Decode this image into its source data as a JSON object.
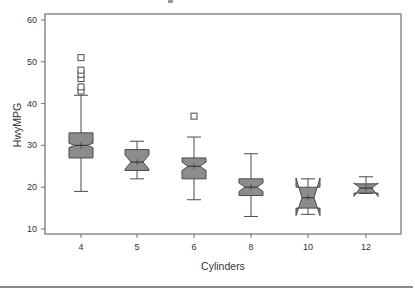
{
  "chart_data": {
    "type": "boxplot",
    "title": "",
    "xlabel": "Cylinders",
    "ylabel": "HwyMPG",
    "ylim": [
      10,
      60
    ],
    "yticks": [
      10,
      20,
      30,
      40,
      50,
      60
    ],
    "categories": [
      "4",
      "5",
      "6",
      "8",
      "10",
      "12"
    ],
    "notched": true,
    "grid": false,
    "legend": null,
    "boxes": [
      {
        "category": "4",
        "whisker_low": 19,
        "q1": 27,
        "median": 30,
        "q3": 33,
        "whisker_high": 42,
        "notch_low": 29.5,
        "notch_high": 30.5,
        "outliers": [
          43,
          44,
          46,
          47,
          48,
          51
        ]
      },
      {
        "category": "5",
        "whisker_low": 22,
        "q1": 24,
        "median": 26,
        "q3": 29,
        "whisker_high": 31,
        "notch_low": 24.3,
        "notch_high": 27.7,
        "outliers": []
      },
      {
        "category": "6",
        "whisker_low": 17,
        "q1": 22,
        "median": 25,
        "q3": 27,
        "whisker_high": 32,
        "notch_low": 24,
        "notch_high": 26,
        "outliers": [
          37
        ]
      },
      {
        "category": "8",
        "whisker_low": 13,
        "q1": 18,
        "median": 20,
        "q3": 22,
        "whisker_high": 28,
        "notch_low": 19,
        "notch_high": 21,
        "outliers": []
      },
      {
        "category": "10",
        "whisker_low": 13.5,
        "q1": 15,
        "median": 17.5,
        "q3": 20,
        "whisker_high": 22,
        "notch_low": 13.2,
        "notch_high": 22.2,
        "outliers": []
      },
      {
        "category": "12",
        "whisker_low": 18.5,
        "q1": 18.6,
        "median": 19.8,
        "q3": 20.8,
        "whisker_high": 22.5,
        "notch_low": 17.8,
        "notch_high": 21,
        "outliers": []
      }
    ],
    "colors": {
      "box_fill": "#8c8c8c",
      "box_stroke": "#4a4a4a",
      "axis": "#6e6e6e",
      "text": "#333333"
    }
  }
}
